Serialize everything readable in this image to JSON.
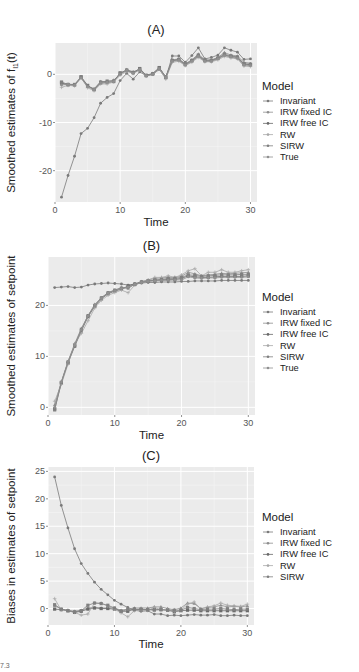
{
  "footnote": "7.3",
  "chart_data": [
    {
      "id": "A",
      "type": "line",
      "title": "(A)",
      "xlabel": "Time",
      "ylabel": "Smoothed estimates of f_I1(t)",
      "ylabel_main": "Smoothed estimates of f",
      "ylabel_sub": "I1",
      "ylabel_tail": "(t)",
      "xlim": [
        0,
        31
      ],
      "ylim": [
        -26.5,
        6.5
      ],
      "xticks": [
        0,
        10,
        20,
        30
      ],
      "yticks": [
        0,
        -10,
        -20
      ],
      "grid": true,
      "legend_title": "Model",
      "legend_position": "right",
      "x": [
        1,
        2,
        3,
        4,
        5,
        6,
        7,
        8,
        9,
        10,
        11,
        12,
        13,
        14,
        15,
        16,
        17,
        18,
        19,
        20,
        21,
        22,
        23,
        24,
        25,
        26,
        27,
        28,
        29,
        30
      ],
      "series": [
        {
          "name": "Invariant",
          "values": [
            -25.5,
            -21,
            -17,
            -12.3,
            -11.2,
            -9,
            -6,
            -4.8,
            -4,
            -1.3,
            0.2,
            -1,
            0.5,
            -0.3,
            0,
            1,
            -0.8,
            3.8,
            3.8,
            2.5,
            3.9,
            5.5,
            3.2,
            3.5,
            4,
            5.5,
            5,
            4.6,
            3.1,
            3.2
          ]
        },
        {
          "name": "IRW fixed IC",
          "values": [
            -2,
            -2,
            -2.2,
            -0.7,
            -2.5,
            -3,
            -1.5,
            -1.5,
            -1.2,
            0,
            1,
            0.5,
            1,
            -0.2,
            0.2,
            1.3,
            -0.5,
            3,
            3.2,
            2.2,
            3,
            4.2,
            3,
            3,
            3.5,
            4.5,
            4,
            3.8,
            2.5,
            2.3
          ]
        },
        {
          "name": "IRW free IC",
          "values": [
            -1.8,
            -2.2,
            -2.2,
            -0.5,
            -2.3,
            -3.2,
            -1.8,
            -1.7,
            -1.5,
            0.3,
            0.8,
            0.3,
            1.2,
            -0.2,
            0.1,
            1.4,
            -0.6,
            2.8,
            3,
            2,
            2.8,
            3.8,
            2.8,
            2.8,
            3.3,
            4,
            3.7,
            3.5,
            2.1,
            2
          ]
        },
        {
          "name": "RW",
          "values": [
            -2.7,
            -2.3,
            -2.4,
            -0.6,
            -2.8,
            -3.4,
            -2,
            -2,
            -1.6,
            -0.2,
            0.6,
            0.2,
            0.9,
            -0.4,
            0,
            1.1,
            -1,
            2.5,
            2.7,
            1.8,
            2.5,
            3.5,
            2.6,
            2.6,
            3,
            3.7,
            3.4,
            3.2,
            1.7,
            1.6
          ]
        },
        {
          "name": "SIRW",
          "values": [
            -1.6,
            -2.1,
            -2.1,
            -0.6,
            -2.4,
            -3.1,
            -1.6,
            -1.4,
            -1.4,
            0.2,
            0.9,
            0.4,
            1.1,
            -0.3,
            0.1,
            1.3,
            -0.6,
            2.9,
            3.1,
            2.1,
            2.9,
            4,
            2.9,
            2.9,
            3.4,
            4.2,
            3.8,
            3.6,
            2.2,
            2.1
          ]
        },
        {
          "name": "True",
          "values": [
            -2.2,
            -2.1,
            -2.3,
            -0.8,
            -2.6,
            -3.2,
            -1.8,
            -1.7,
            -1.5,
            0,
            0.8,
            0.2,
            1,
            -0.3,
            0,
            1.2,
            -0.7,
            2.7,
            2.9,
            1.9,
            2.7,
            3.7,
            2.7,
            2.7,
            3.2,
            3.9,
            3.6,
            3.3,
            1.9,
            1.8
          ]
        }
      ]
    },
    {
      "id": "B",
      "type": "line",
      "title": "(B)",
      "xlabel": "Time",
      "ylabel": "Smoothed estimates of setpoint",
      "xlim": [
        0,
        31
      ],
      "ylim": [
        -1.5,
        29.5
      ],
      "xticks": [
        0,
        10,
        20,
        30
      ],
      "yticks": [
        0,
        10,
        20
      ],
      "grid": true,
      "legend_title": "Model",
      "legend_position": "right",
      "x": [
        1,
        2,
        3,
        4,
        5,
        6,
        7,
        8,
        9,
        10,
        11,
        12,
        13,
        14,
        15,
        16,
        17,
        18,
        19,
        20,
        21,
        22,
        23,
        24,
        25,
        26,
        27,
        28,
        29,
        30
      ],
      "series": [
        {
          "name": "Invariant",
          "values": [
            23.5,
            23.6,
            23.7,
            23.5,
            23.6,
            24,
            24.2,
            24.3,
            24.4,
            24.3,
            24.2,
            24,
            24.2,
            24.4,
            24.5,
            24.5,
            24.6,
            24.6,
            24.6,
            24.7,
            24.7,
            24.8,
            24.8,
            24.8,
            24.8,
            24.9,
            24.9,
            24.9,
            24.9,
            24.9
          ]
        },
        {
          "name": "IRW fixed IC",
          "values": [
            0.5,
            5,
            9,
            12.5,
            15.5,
            18,
            20.2,
            21.5,
            22.5,
            23,
            23.5,
            23.3,
            24.2,
            24.7,
            25,
            25.3,
            25.4,
            25.5,
            25.5,
            25.7,
            26.5,
            26.2,
            25.8,
            26,
            26.1,
            26.3,
            26.2,
            26.3,
            26.4,
            26.5
          ]
        },
        {
          "name": "IRW free IC",
          "values": [
            -0.3,
            4.8,
            8.7,
            12,
            15,
            17.8,
            19.8,
            21.3,
            22.3,
            22.8,
            23.2,
            23.8,
            24.2,
            24.6,
            24.8,
            24.9,
            25,
            25.1,
            25.1,
            25.3,
            25.8,
            25.6,
            25.5,
            25.5,
            25.6,
            25.7,
            25.7,
            25.7,
            25.7,
            25.8
          ]
        },
        {
          "name": "RW",
          "values": [
            1.2,
            4.5,
            8.5,
            12.5,
            14.5,
            17,
            19.5,
            21,
            22,
            22.5,
            23,
            22.5,
            24,
            24.5,
            25,
            25.5,
            25.5,
            25.8,
            25.5,
            26,
            26.8,
            27.2,
            25.8,
            26.5,
            26.5,
            27,
            26.5,
            26.5,
            26.8,
            27
          ]
        },
        {
          "name": "SIRW",
          "values": [
            -0.5,
            4.9,
            8.9,
            12.2,
            15.3,
            18,
            20,
            21.5,
            22.5,
            23,
            23.4,
            23.6,
            24.1,
            24.5,
            24.8,
            25,
            25.1,
            25.3,
            25.3,
            25.5,
            26,
            25.9,
            25.7,
            25.8,
            25.9,
            26,
            26,
            26,
            26.1,
            26.1
          ]
        },
        {
          "name": "True",
          "values": [
            0,
            5,
            9,
            12.2,
            15.2,
            17.9,
            20,
            21.4,
            22.4,
            22.9,
            23.3,
            23.6,
            24.1,
            24.5,
            24.7,
            24.8,
            24.9,
            24.9,
            25,
            25,
            25.6,
            25.4,
            25.3,
            25.4,
            25.4,
            25.5,
            25.5,
            25.5,
            25.5,
            25.6
          ]
        }
      ]
    },
    {
      "id": "C",
      "type": "line",
      "title": "(C)",
      "xlabel": "Time",
      "ylabel": "Biases in estimates of setpoint",
      "xlim": [
        0,
        31
      ],
      "ylim": [
        -3,
        25.8
      ],
      "xticks": [
        0,
        10,
        20,
        30
      ],
      "yticks": [
        0,
        5,
        10,
        15,
        20,
        25
      ],
      "grid": true,
      "legend_title": "Model",
      "legend_position": "right",
      "x": [
        1,
        2,
        3,
        4,
        5,
        6,
        7,
        8,
        9,
        10,
        11,
        12,
        13,
        14,
        15,
        16,
        17,
        18,
        19,
        20,
        21,
        22,
        23,
        24,
        25,
        26,
        27,
        28,
        29,
        30
      ],
      "series": [
        {
          "name": "Invariant",
          "values": [
            24,
            18.8,
            14.7,
            10.9,
            8.2,
            6.4,
            4.8,
            3.5,
            2.5,
            1.5,
            0.8,
            0.2,
            -0.3,
            -0.5,
            -0.4,
            -1,
            -1,
            -1.3,
            -1.2,
            -1.3,
            -1.2,
            -1.1,
            -1.2,
            -1.2,
            -1.1,
            -1.3,
            -1.3,
            -1.2,
            -1.3,
            -1.3
          ]
        },
        {
          "name": "IRW fixed IC",
          "values": [
            0.5,
            -0.1,
            -0.3,
            -0.5,
            -0.3,
            0.1,
            0.2,
            0.1,
            0.1,
            0.1,
            -0.3,
            -0.1,
            0.1,
            0.1,
            0.1,
            0.3,
            0.3,
            0,
            -0.2,
            0.1,
            1,
            0.9,
            0,
            0.2,
            0.3,
            0.6,
            0.3,
            0.4,
            0.3,
            0.5
          ]
        },
        {
          "name": "IRW free IC",
          "values": [
            -0.1,
            -0.2,
            -0.4,
            -0.7,
            -0.5,
            -0.1,
            0.1,
            0,
            0,
            -0.1,
            -0.5,
            -0.5,
            -0.1,
            -0.2,
            -0.2,
            -0.1,
            -0.2,
            -0.3,
            -0.6,
            -0.4,
            -0.3,
            -0.3,
            -0.4,
            -0.4,
            -0.4,
            -0.4,
            -0.4,
            -0.4,
            -0.4,
            -0.4
          ]
        },
        {
          "name": "RW",
          "values": [
            1.8,
            -0.3,
            -0.3,
            -0.7,
            -1.2,
            -1,
            1,
            1,
            0.4,
            -0.1,
            -0.8,
            -1.5,
            -0.4,
            -0.3,
            -0.3,
            0.2,
            -0.2,
            -0.2,
            -0.5,
            -0.3,
            0.8,
            1.2,
            -0.1,
            0.3,
            0.5,
            1,
            0.6,
            0.5,
            0.4,
            0.8
          ]
        },
        {
          "name": "SIRW",
          "values": [
            0.7,
            -0.1,
            -0.4,
            -0.6,
            -0.4,
            0.6,
            1,
            0.9,
            0.6,
            0.1,
            -0.5,
            -0.2,
            -0.2,
            -0.1,
            -0.2,
            -0.3,
            -0.2,
            -0.3,
            -0.3,
            -0.3,
            0.2,
            0,
            -0.2,
            -0.1,
            -0.1,
            0,
            -0.1,
            -0.2,
            -0.1,
            -0.1
          ]
        }
      ]
    }
  ],
  "styles": {
    "panel_bg": "#ebebeb",
    "grid_color": "#ffffff",
    "series_colors": {
      "Invariant": "#7a7a7a",
      "IRW fixed IC": "#8e8e8e",
      "IRW free IC": "#6a6a6a",
      "RW": "#a8a8a8",
      "SIRW": "#808080",
      "True": "#909090"
    }
  }
}
